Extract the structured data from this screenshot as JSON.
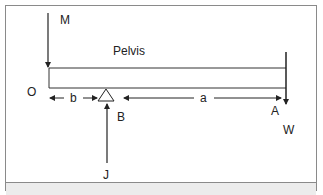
{
  "diagram": {
    "type": "lever-free-body-diagram",
    "labels": {
      "muscle_force": "M",
      "body_segment": "Pelvis",
      "origin": "O",
      "fulcrum": "B",
      "load_point": "A",
      "load_force": "W",
      "joint_reaction": "J",
      "short_arm": "b",
      "long_arm": "a"
    },
    "colors": {
      "stroke": "#222222",
      "frame": "#8a8a8a",
      "footer": "#ececec"
    }
  }
}
